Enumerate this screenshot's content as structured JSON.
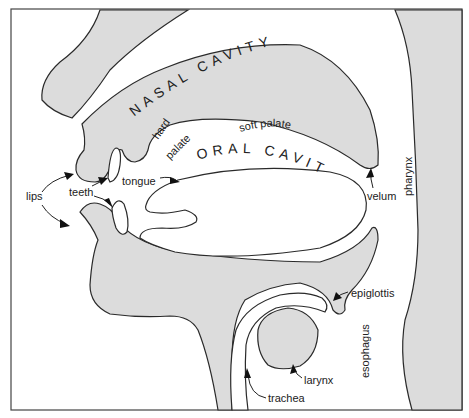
{
  "diagram": {
    "regions": {
      "nasal_cavity": "NASAL CAVITY",
      "oral_cavity": "ORAL CAVITY"
    },
    "labels": {
      "lips": "lips",
      "teeth": "teeth",
      "tongue": "tongue",
      "hard_palate_1": "hard",
      "hard_palate_2": "palate",
      "soft_palate": "soft palate",
      "velum": "velum",
      "pharynx": "pharynx",
      "epiglottis": "epiglottis",
      "esophagus": "esophagus",
      "larynx": "larynx",
      "trachea": "trachea"
    },
    "colors": {
      "tissue_fill": "#dcdcdc",
      "outline": "#2a2a2a",
      "background": "#ffffff"
    }
  }
}
